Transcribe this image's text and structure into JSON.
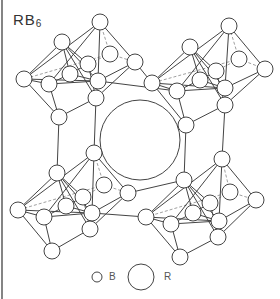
{
  "title": {
    "formula_base": "RB",
    "formula_sub": "6"
  },
  "legend": {
    "items": [
      {
        "label": "B",
        "radius": 5,
        "cx": 97,
        "cy": 277,
        "label_x": 109,
        "label_y": 271
      },
      {
        "label": "R",
        "radius": 13,
        "cx": 141,
        "cy": 277,
        "label_x": 164,
        "label_y": 271
      }
    ]
  },
  "colors": {
    "stroke": "#444444",
    "dashed": "#888888",
    "fill": "#ffffff",
    "border": "#333333"
  },
  "central_sphere": {
    "label": "R",
    "cx": 140,
    "cy": 140,
    "r": 40
  },
  "atom_radius": 8,
  "octahedra": [
    {
      "name": "top-left",
      "nodes": {
        "top": [
          100,
          22
        ],
        "ul": [
          62,
          42
        ],
        "left": [
          24,
          79
        ],
        "ml": [
          49,
          84
        ],
        "center": [
          70,
          74
        ],
        "inner": [
          88,
          64
        ],
        "back": [
          110,
          54
        ],
        "right": [
          135,
          62
        ],
        "rm": [
          98,
          81
        ],
        "br": [
          96,
          98
        ],
        "bottom": [
          59,
          117
        ]
      }
    },
    {
      "name": "top-right",
      "nodes": {
        "top": [
          229,
          26
        ],
        "ul": [
          190,
          47
        ],
        "left": [
          152,
          83
        ],
        "ml": [
          177,
          91
        ],
        "center": [
          200,
          80
        ],
        "inner": [
          216,
          71
        ],
        "back": [
          239,
          59
        ],
        "right": [
          265,
          69
        ],
        "rm": [
          225,
          88
        ],
        "br": [
          225,
          105
        ],
        "bottom": [
          186,
          125
        ]
      }
    },
    {
      "name": "bottom-left",
      "nodes": {
        "top": [
          94,
          153
        ],
        "ul": [
          57,
          173
        ],
        "left": [
          18,
          210
        ],
        "ml": [
          44,
          217
        ],
        "center": [
          66,
          206
        ],
        "inner": [
          83,
          197
        ],
        "back": [
          104,
          185
        ],
        "right": [
          128,
          193
        ],
        "rm": [
          92,
          213
        ],
        "br": [
          90,
          229
        ],
        "bottom": [
          52,
          251
        ]
      }
    },
    {
      "name": "bottom-right",
      "nodes": {
        "top": [
          222,
          159
        ],
        "ul": [
          184,
          180
        ],
        "left": [
          146,
          217
        ],
        "ml": [
          171,
          224
        ],
        "center": [
          193,
          213
        ],
        "inner": [
          210,
          203
        ],
        "back": [
          230,
          192
        ],
        "right": [
          256,
          200
        ],
        "rm": [
          219,
          221
        ],
        "br": [
          218,
          237
        ],
        "bottom": [
          180,
          257
        ]
      }
    }
  ],
  "octa_edges": [
    [
      "top",
      "left"
    ],
    [
      "top",
      "right"
    ],
    [
      "top",
      "ml"
    ],
    [
      "top",
      "rm"
    ],
    [
      "ul",
      "left"
    ],
    [
      "ul",
      "center"
    ],
    [
      "ul",
      "rm"
    ],
    [
      "ul",
      "br"
    ],
    [
      "left",
      "ml"
    ],
    [
      "left",
      "bottom"
    ],
    [
      "ml",
      "rm"
    ],
    [
      "ml",
      "bottom"
    ],
    [
      "rm",
      "right"
    ],
    [
      "right",
      "br"
    ],
    [
      "br",
      "bottom"
    ],
    [
      "rm",
      "br"
    ],
    [
      "left",
      "rm"
    ],
    [
      "center",
      "inner"
    ],
    [
      "inner",
      "br"
    ],
    [
      "ul",
      "inner"
    ],
    [
      "ml",
      "center"
    ],
    [
      "center",
      "rm"
    ]
  ],
  "octa_dashed_edges": [
    [
      "back",
      "top"
    ],
    [
      "back",
      "right"
    ],
    [
      "back",
      "left"
    ],
    [
      "back",
      "inner"
    ]
  ],
  "links": [
    [
      [
        59,
        117
      ],
      [
        57,
        173
      ]
    ],
    [
      [
        96,
        98
      ],
      [
        94,
        153
      ]
    ],
    [
      [
        186,
        125
      ],
      [
        184,
        180
      ]
    ],
    [
      [
        225,
        105
      ],
      [
        222,
        159
      ]
    ],
    [
      [
        135,
        62
      ],
      [
        152,
        83
      ]
    ],
    [
      [
        98,
        81
      ],
      [
        177,
        91
      ]
    ],
    [
      [
        128,
        193
      ],
      [
        184,
        180
      ]
    ],
    [
      [
        92,
        213
      ],
      [
        146,
        217
      ]
    ]
  ]
}
